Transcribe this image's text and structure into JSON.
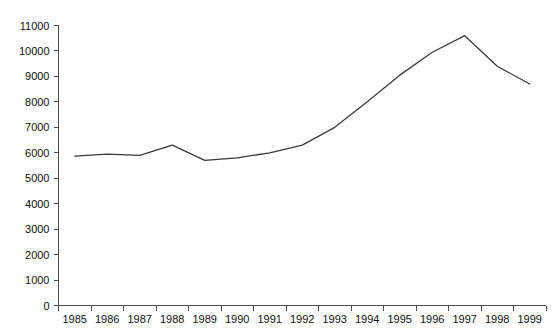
{
  "chart_data": {
    "type": "line",
    "title": "",
    "subtitle": "",
    "xlabel": "",
    "ylabel": "",
    "categories": [
      "1985",
      "1986",
      "1987",
      "1988",
      "1989",
      "1990",
      "1991",
      "1992",
      "1993",
      "1994",
      "1995",
      "1996",
      "1997",
      "1998",
      "1999"
    ],
    "x": [
      1985,
      1986,
      1987,
      1988,
      1989,
      1990,
      1991,
      1992,
      1993,
      1994,
      1995,
      1996,
      1997,
      1998,
      1999
    ],
    "values": [
      5870,
      5950,
      5900,
      6300,
      5700,
      5800,
      6000,
      6300,
      7000,
      8000,
      9050,
      9950,
      10600,
      9400,
      8700
    ],
    "series": [
      {
        "name": "",
        "values": [
          5870,
          5950,
          5900,
          6300,
          5700,
          5800,
          6000,
          6300,
          7000,
          8000,
          9050,
          9950,
          10600,
          9400,
          8700
        ],
        "color": "#3a3a3a"
      }
    ],
    "ylim": [
      0,
      11000
    ],
    "yticks": [
      0,
      1000,
      2000,
      3000,
      4000,
      5000,
      6000,
      7000,
      8000,
      9000,
      10000,
      11000
    ],
    "ytick_labels": [
      "0",
      "1000",
      "2000",
      "3000",
      "4000",
      "5000",
      "6000",
      "7000",
      "8000",
      "9000",
      "10000",
      "11000"
    ],
    "xtick_labels": [
      "1985",
      "1986",
      "1987",
      "1988",
      "1989",
      "1990",
      "1991",
      "1992",
      "1993",
      "1994",
      "1995",
      "1996",
      "1997",
      "1998",
      "1999"
    ],
    "grid": false,
    "legend": false,
    "legend_position": "none",
    "annotations": [],
    "axis_color": "#4a4a4a",
    "line_color": "#3a3a3a",
    "background_color": "#ffffff"
  }
}
